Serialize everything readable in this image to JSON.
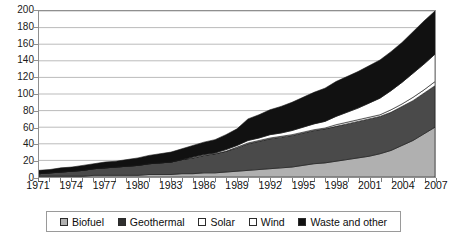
{
  "chart_data": {
    "type": "area",
    "stacked": true,
    "title": "",
    "xlabel": "",
    "ylabel": "",
    "grid": true,
    "legend_position": "bottom",
    "xlim": [
      1971,
      2007
    ],
    "ylim": [
      0,
      200
    ],
    "ytick_step": 20,
    "yticks": [
      0,
      20,
      40,
      60,
      80,
      100,
      120,
      140,
      160,
      180,
      200
    ],
    "ytick_labels": [
      "0",
      "20",
      "40",
      "60",
      "80",
      "100",
      "120",
      "140",
      "160",
      "180",
      "200"
    ],
    "x": [
      1971,
      1972,
      1973,
      1974,
      1975,
      1976,
      1977,
      1978,
      1979,
      1980,
      1981,
      1982,
      1983,
      1984,
      1985,
      1986,
      1987,
      1988,
      1989,
      1990,
      1991,
      1992,
      1993,
      1994,
      1995,
      1996,
      1997,
      1998,
      1999,
      2000,
      2001,
      2002,
      2003,
      2004,
      2005,
      2006,
      2007
    ],
    "xtick_labels": [
      "1971",
      "1974",
      "1977",
      "1980",
      "1983",
      "1986",
      "1989",
      "1992",
      "1995",
      "1998",
      "2001",
      "2004",
      "2007"
    ],
    "xticks_labeled": [
      1971,
      1974,
      1977,
      1980,
      1983,
      1986,
      1989,
      1992,
      1995,
      1998,
      2001,
      2004,
      2007
    ],
    "series": [
      {
        "name": "Biofuel",
        "color": "#b0b0b0",
        "values": [
          1,
          1,
          1,
          1,
          1,
          2,
          2,
          2,
          2,
          2,
          3,
          3,
          3,
          4,
          4,
          5,
          5,
          6,
          7,
          8,
          9,
          10,
          11,
          12,
          14,
          16,
          17,
          19,
          21,
          23,
          25,
          28,
          32,
          38,
          44,
          52,
          60
        ]
      },
      {
        "name": "Geothermal",
        "color": "#4a4a4a",
        "values": [
          3,
          4,
          5,
          6,
          7,
          8,
          9,
          10,
          11,
          12,
          13,
          14,
          15,
          17,
          19,
          21,
          23,
          25,
          28,
          32,
          34,
          36,
          37,
          38,
          39,
          40,
          41,
          42,
          43,
          44,
          45,
          45,
          46,
          47,
          48,
          49,
          50
        ]
      },
      {
        "name": "Solar",
        "color": "#ffffff",
        "values": [
          0,
          0,
          0,
          0,
          0,
          0,
          0,
          0,
          0,
          0,
          0,
          0,
          0,
          0,
          0,
          0,
          0,
          0,
          1,
          1,
          1,
          1,
          1,
          1,
          1,
          1,
          1,
          2,
          2,
          2,
          2,
          2,
          3,
          3,
          4,
          4,
          5
        ]
      },
      {
        "name": "Wind",
        "color": "#ffffff",
        "values": [
          0,
          0,
          0,
          0,
          0,
          0,
          0,
          0,
          0,
          0,
          0,
          0,
          0,
          0,
          1,
          1,
          1,
          2,
          2,
          3,
          3,
          4,
          4,
          5,
          6,
          7,
          8,
          10,
          12,
          14,
          17,
          20,
          23,
          26,
          29,
          31,
          33
        ]
      },
      {
        "name": "Waste and other",
        "color": "#111111",
        "values": [
          4,
          4,
          5,
          5,
          6,
          6,
          7,
          7,
          8,
          9,
          10,
          11,
          12,
          13,
          14,
          15,
          16,
          18,
          20,
          26,
          28,
          30,
          32,
          34,
          36,
          38,
          40,
          42,
          43,
          44,
          45,
          46,
          47,
          48,
          50,
          52,
          52
        ]
      }
    ],
    "totals": [
      8,
      9,
      11,
      12,
      14,
      16,
      18,
      19,
      21,
      23,
      26,
      28,
      30,
      34,
      38,
      42,
      45,
      51,
      58,
      70,
      75,
      81,
      85,
      90,
      96,
      102,
      107,
      115,
      121,
      127,
      134,
      141,
      151,
      162,
      175,
      188,
      200
    ]
  },
  "legend": {
    "items": [
      {
        "label": "Biofuel",
        "color": "#b0b0b0"
      },
      {
        "label": "Geothermal",
        "color": "#2f2f2f"
      },
      {
        "label": "Solar",
        "color": "#ffffff"
      },
      {
        "label": "Wind",
        "color": "#ffffff"
      },
      {
        "label": "Waste and other",
        "color": "#111111"
      }
    ]
  }
}
